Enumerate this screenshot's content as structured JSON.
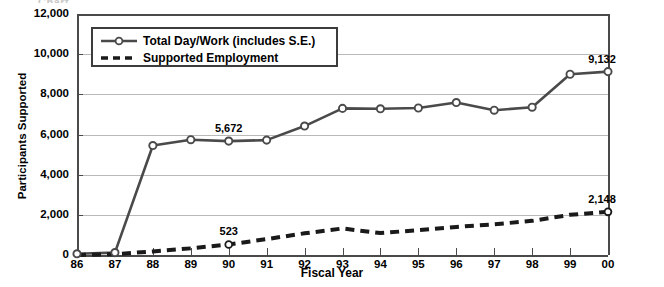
{
  "chart_data": {
    "type": "line",
    "title": "",
    "xlabel": "Fiscal Year",
    "ylabel": "Participants Supported",
    "x": [
      "86",
      "87",
      "88",
      "89",
      "90",
      "91",
      "92",
      "93",
      "94",
      "95",
      "96",
      "97",
      "98",
      "99",
      "00"
    ],
    "ylim": [
      0,
      12000
    ],
    "yticks": [
      0,
      2000,
      4000,
      6000,
      8000,
      10000,
      12000
    ],
    "ytick_labels": [
      "0",
      "2,000",
      "4,000",
      "6,000",
      "8,000",
      "10,000",
      "12,000"
    ],
    "grid": true,
    "legend_position": "top-left-inside",
    "series": [
      {
        "name": "Total Day/Work (includes S.E.)",
        "style": "solid",
        "marker": "circle",
        "color": "#4a4a4a",
        "values": [
          60,
          120,
          5450,
          5740,
          5672,
          5720,
          6420,
          7300,
          7280,
          7320,
          7590,
          7210,
          7360,
          9000,
          9132
        ]
      },
      {
        "name": "Supported Employment",
        "style": "dashed",
        "marker": "none",
        "color": "#1a1a1a",
        "values": [
          0,
          40,
          180,
          330,
          523,
          790,
          1080,
          1320,
          1090,
          1240,
          1400,
          1530,
          1700,
          2000,
          2148
        ]
      }
    ],
    "annotations": [
      {
        "series": "Total Day/Work (includes S.E.)",
        "x": "90",
        "value": 5672,
        "label": "5,672"
      },
      {
        "series": "Total Day/Work (includes S.E.)",
        "x": "00",
        "value": 9132,
        "label": "9,132"
      },
      {
        "series": "Supported Employment",
        "x": "90",
        "value": 523,
        "label": "523"
      },
      {
        "series": "Supported Employment",
        "x": "00",
        "value": 2148,
        "label": "2,148"
      }
    ]
  },
  "legend": {
    "items": [
      {
        "label": "Total Day/Work (includes S.E.)",
        "key": "solid-line-circle-marker"
      },
      {
        "label": "Supported Employment",
        "key": "dashed-line"
      }
    ]
  },
  "title_sliver": {
    "text": "Chart"
  },
  "colors": {
    "series_primary": "#4a4a4a",
    "series_secondary": "#1a1a1a",
    "gridline": "#b9b9b9",
    "axis": "#4a4a4a",
    "background": "#ffffff"
  }
}
